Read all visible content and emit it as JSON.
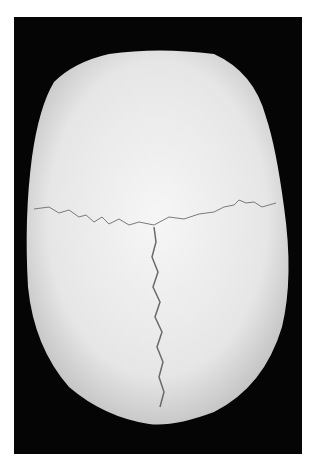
{
  "image": {
    "subject": "skull",
    "view": "superior",
    "background_color": "#050505",
    "bone_color": "#ececec",
    "features": [
      "coronal-suture",
      "sagittal-suture"
    ]
  }
}
